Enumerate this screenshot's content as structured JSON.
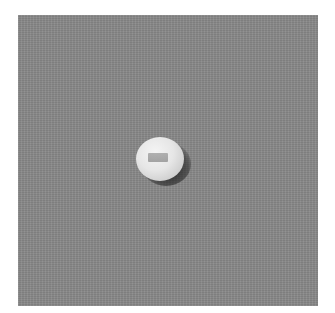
{
  "image": {
    "subject": "white round pill",
    "background_color": "#8a8a8a",
    "pill_color": "#e6e6e6",
    "imprint_color": "#8f8f8f"
  }
}
